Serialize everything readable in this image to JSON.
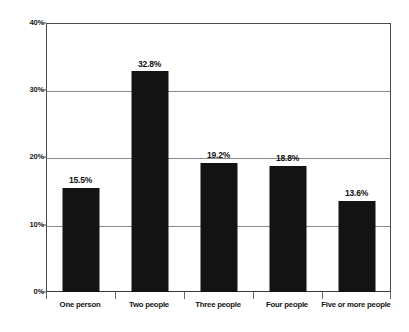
{
  "chart_data": {
    "type": "bar",
    "title": "",
    "subtitle": "",
    "xlabel": "",
    "ylabel": "",
    "categories": [
      "One person",
      "Two people",
      "Three people",
      "Four people",
      "Five or more people"
    ],
    "values": [
      15.5,
      32.8,
      19.2,
      18.8,
      13.6
    ],
    "value_labels": [
      "15.5%",
      "32.8%",
      "19.2%",
      "18.8%",
      "13.6%"
    ],
    "ylim": [
      0,
      40
    ],
    "y_ticks": [
      0,
      10,
      20,
      30,
      40
    ],
    "y_tick_labels": [
      "0%",
      "10%",
      "20%",
      "30%",
      "40%"
    ],
    "grid": "horizontal",
    "legend": "none",
    "bar_color": "#131313",
    "gridline_color": "#8a8a8a",
    "axis_color": "#4a4a4a",
    "background_color": "#ffffff",
    "annotations": []
  }
}
